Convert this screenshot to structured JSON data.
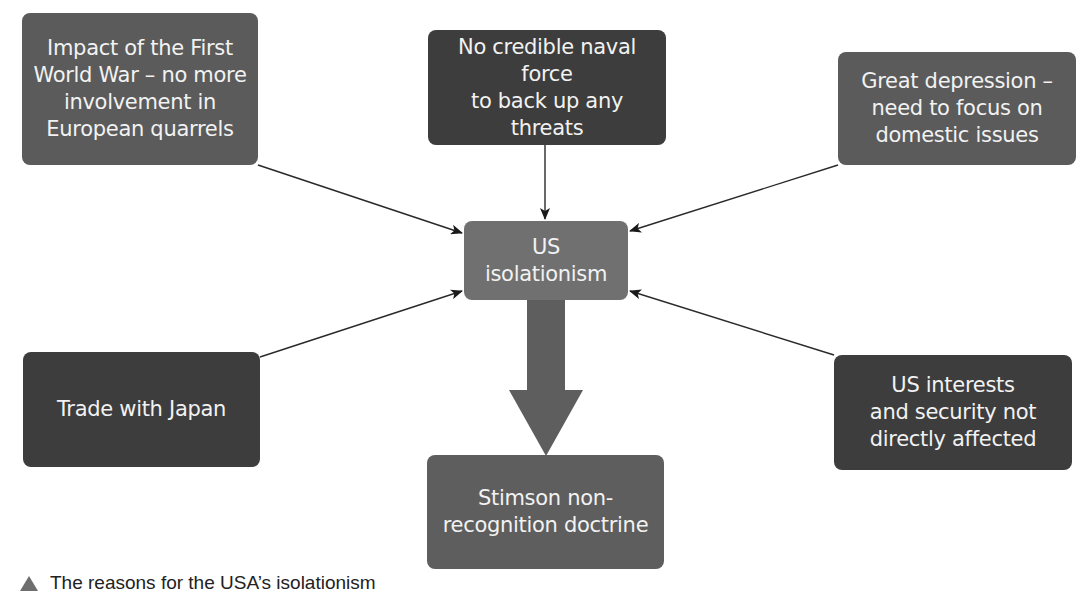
{
  "diagram": {
    "center": {
      "label": "US isolationism",
      "color": "#707070"
    },
    "causes": [
      {
        "id": "ww1",
        "label": "Impact of the First World War – no more involvement in European quarrels",
        "lines": [
          "Impact of the First",
          "World War – no more",
          "involvement in",
          "European quarrels"
        ],
        "color": "#5b5b5b"
      },
      {
        "id": "naval",
        "label": "No credible naval force to back up any threats",
        "lines": [
          "No credible naval force",
          "to back up any threats"
        ],
        "color": "#3d3d3d"
      },
      {
        "id": "depression",
        "label": "Great depression – need to focus on domestic issues",
        "lines": [
          "Great depression –",
          "need to focus on",
          "domestic issues"
        ],
        "color": "#5b5b5b"
      },
      {
        "id": "trade",
        "label": "Trade with Japan",
        "lines": [
          "Trade with Japan"
        ],
        "color": "#3d3d3d"
      },
      {
        "id": "interests",
        "label": "US interests and security not directly affected",
        "lines": [
          "US interests",
          "and security not",
          "directly affected"
        ],
        "color": "#3d3d3d"
      }
    ],
    "outcome": {
      "label": "Stimson non-recognition doctrine",
      "lines": [
        "Stimson non-",
        "recognition doctrine"
      ],
      "color": "#5e5e5e"
    },
    "edges": [
      {
        "from": "ww1",
        "to": "center"
      },
      {
        "from": "naval",
        "to": "center"
      },
      {
        "from": "depression",
        "to": "center"
      },
      {
        "from": "trade",
        "to": "center"
      },
      {
        "from": "interests",
        "to": "center"
      },
      {
        "from": "center",
        "to": "outcome",
        "style": "big-arrow"
      }
    ]
  },
  "caption": {
    "marker": "triangle-icon",
    "text": "The reasons for the USA’s isolationism"
  }
}
